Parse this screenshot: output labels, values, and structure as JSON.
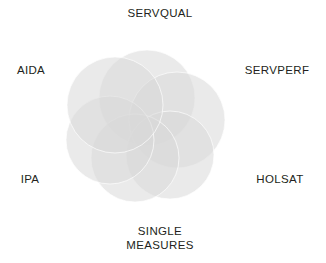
{
  "figure": {
    "type": "venn-diagram",
    "background_color": "#ffffff",
    "width": 326,
    "height": 263,
    "text_color": "#231f20"
  },
  "chart_data": {
    "type": "diagram",
    "subtype": "venn",
    "title": "",
    "set_count": 6,
    "sets": [
      {
        "label": "SERVQUAL"
      },
      {
        "label": "SERVPERF"
      },
      {
        "label": "HOLSAT"
      },
      {
        "label": "SINGLE\nMEASURES"
      },
      {
        "label": "IPA"
      },
      {
        "label": "AIDA"
      }
    ],
    "legend": "none",
    "grid": false
  },
  "labels": [
    {
      "id": "servqual",
      "text": "SERVQUAL",
      "x": 160,
      "y": 14,
      "position": "top"
    },
    {
      "id": "servperf",
      "text": "SERVPERF",
      "x": 277,
      "y": 71,
      "position": "upper-right"
    },
    {
      "id": "holsat",
      "text": "HOLSAT",
      "x": 280,
      "y": 180,
      "position": "lower-right"
    },
    {
      "id": "single-measures",
      "text": "SINGLE\nMEASURES",
      "x": 160,
      "y": 238,
      "position": "bottom"
    },
    {
      "id": "ipa",
      "text": "IPA",
      "x": 30,
      "y": 180,
      "position": "lower-left"
    },
    {
      "id": "aida",
      "text": "AIDA",
      "x": 31,
      "y": 71,
      "position": "upper-left"
    }
  ],
  "circles": [
    {
      "id": "circle-servqual",
      "cx": 147,
      "cy": 98,
      "r": 48,
      "fill": "#d9d9d9",
      "opacity": 0.55
    },
    {
      "id": "circle-servperf",
      "cx": 177,
      "cy": 120,
      "r": 48,
      "fill": "#d9d9d9",
      "opacity": 0.55
    },
    {
      "id": "circle-holsat",
      "cx": 170,
      "cy": 155,
      "r": 44,
      "fill": "#d9d9d9",
      "opacity": 0.55
    },
    {
      "id": "circle-single",
      "cx": 135,
      "cy": 158,
      "r": 44,
      "fill": "#d9d9d9",
      "opacity": 0.55
    },
    {
      "id": "circle-ipa",
      "cx": 110,
      "cy": 140,
      "r": 44,
      "fill": "#d9d9d9",
      "opacity": 0.55
    },
    {
      "id": "circle-aida",
      "cx": 115,
      "cy": 105,
      "r": 48,
      "fill": "#d9d9d9",
      "opacity": 0.55
    }
  ]
}
